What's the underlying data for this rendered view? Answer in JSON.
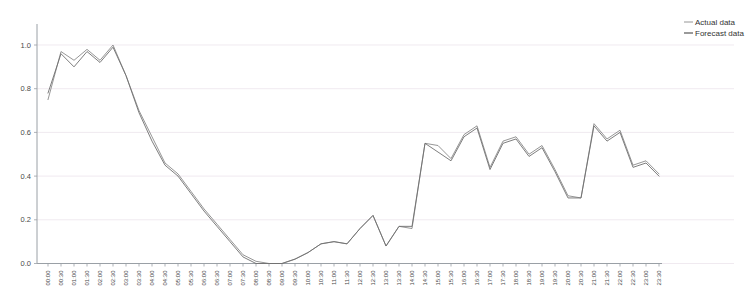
{
  "chart_data": {
    "type": "line",
    "title": "",
    "xlabel": "",
    "ylabel": "",
    "ylim": [
      0.0,
      1.05
    ],
    "yticks": [
      "0.0",
      "0.2",
      "0.4",
      "0.6",
      "0.8",
      "1.0"
    ],
    "ytick_values": [
      0.0,
      0.2,
      0.4,
      0.6,
      0.8,
      1.0
    ],
    "grid": true,
    "legend_position": "top-right",
    "x": [
      "00:00",
      "00:30",
      "01:00",
      "01:30",
      "02:00",
      "02:30",
      "03:00",
      "03:30",
      "04:00",
      "04:30",
      "05:00",
      "05:30",
      "06:00",
      "06:30",
      "07:00",
      "07:30",
      "08:00",
      "08:30",
      "09:00",
      "09:30",
      "10:00",
      "10:30",
      "11:00",
      "11:30",
      "12:00",
      "12:30",
      "13:00",
      "13:30",
      "14:00",
      "14:30",
      "15:00",
      "15:30",
      "16:00",
      "16:30",
      "17:00",
      "17:30",
      "18:00",
      "18:30",
      "19:00",
      "19:30",
      "20:00",
      "20:30",
      "21:00",
      "21:30",
      "22:00",
      "22:30",
      "23:00",
      "23:30"
    ],
    "series": [
      {
        "name": "Actual data",
        "color": "#8a8a8a",
        "values": [
          0.75,
          0.97,
          0.93,
          0.98,
          0.93,
          1.0,
          0.64,
          0.47,
          0.35,
          0.25,
          0.17,
          0.09,
          0.02,
          0.0,
          0.0,
          0.03,
          0.09,
          0.09,
          0.09,
          0.17,
          0.22,
          0.08,
          0.16,
          0.17,
          0.55,
          0.53,
          0.48,
          0.59,
          0.62,
          0.44,
          0.56,
          0.58,
          0.5,
          0.54,
          0.43,
          0.3,
          0.31,
          0.64,
          0.56,
          0.61,
          0.44,
          0.48,
          0.41,
          0.32,
          0.66,
          0.51,
          0.62,
          0.68
        ]
      },
      {
        "name": "Forecast data",
        "color": "#6f6f6f",
        "values": [
          0.78,
          0.96,
          0.9,
          0.97,
          0.92,
          0.99,
          0.66,
          0.45,
          0.33,
          0.24,
          0.16,
          0.09,
          0.02,
          0.0,
          0.0,
          0.03,
          0.09,
          0.09,
          0.1,
          0.17,
          0.22,
          0.08,
          0.16,
          0.18,
          0.55,
          0.5,
          0.47,
          0.58,
          0.62,
          0.43,
          0.55,
          0.57,
          0.49,
          0.53,
          0.42,
          0.3,
          0.3,
          0.63,
          0.55,
          0.6,
          0.43,
          0.47,
          0.4,
          0.31,
          0.65,
          0.5,
          0.61,
          0.67
        ]
      }
    ],
    "full_series": [
      {
        "name": "Actual data",
        "values": [
          0.75,
          0.97,
          0.93,
          0.98,
          0.93,
          1.0,
          0.86,
          0.7,
          0.58,
          0.46,
          0.41,
          0.33,
          0.25,
          0.18,
          0.11,
          0.04,
          0.01,
          0.0,
          0.0,
          0.02,
          0.05,
          0.09,
          0.1,
          0.09,
          0.16,
          0.22,
          0.08,
          0.17,
          0.16,
          0.55,
          0.54,
          0.48,
          0.59,
          0.63,
          0.44,
          0.56,
          0.58,
          0.5,
          0.54,
          0.43,
          0.31,
          0.3,
          0.64,
          0.57,
          0.61,
          0.45,
          0.47,
          0.41
        ]
      },
      {
        "name": "Forecast data",
        "values": [
          0.78,
          0.96,
          0.9,
          0.97,
          0.92,
          0.99,
          0.86,
          0.69,
          0.56,
          0.45,
          0.4,
          0.32,
          0.24,
          0.17,
          0.1,
          0.03,
          0.0,
          0.0,
          0.0,
          0.02,
          0.05,
          0.09,
          0.1,
          0.09,
          0.16,
          0.22,
          0.08,
          0.17,
          0.17,
          0.55,
          0.51,
          0.47,
          0.58,
          0.62,
          0.43,
          0.55,
          0.57,
          0.49,
          0.53,
          0.42,
          0.3,
          0.3,
          0.63,
          0.56,
          0.6,
          0.44,
          0.46,
          0.4
        ]
      }
    ]
  },
  "legend": {
    "items": [
      {
        "label": "Actual data",
        "color": "#8a8a8a"
      },
      {
        "label": "Forecast data",
        "color": "#6f6f6f"
      }
    ]
  },
  "axis": {
    "y_ticks": [
      "1.0",
      "0.8",
      "0.6",
      "0.4",
      "0.2",
      "0.0"
    ],
    "x_ticks": [
      "00:00",
      "00:30",
      "01:00",
      "01:30",
      "02:00",
      "02:30",
      "03:00",
      "03:30",
      "04:00",
      "04:30",
      "05:00",
      "05:30",
      "06:00",
      "06:30",
      "07:00",
      "07:30",
      "08:00",
      "08:30",
      "09:00",
      "09:30",
      "10:00",
      "10:30",
      "11:00",
      "11:30",
      "12:00",
      "12:30",
      "13:00",
      "13:30",
      "14:00",
      "14:30",
      "15:00",
      "15:30",
      "16:00",
      "16:30",
      "17:00",
      "17:30",
      "18:00",
      "18:30",
      "19:00",
      "19:30",
      "20:00",
      "20:30",
      "21:00",
      "21:30",
      "22:00",
      "22:30",
      "23:00",
      "23:30"
    ]
  }
}
